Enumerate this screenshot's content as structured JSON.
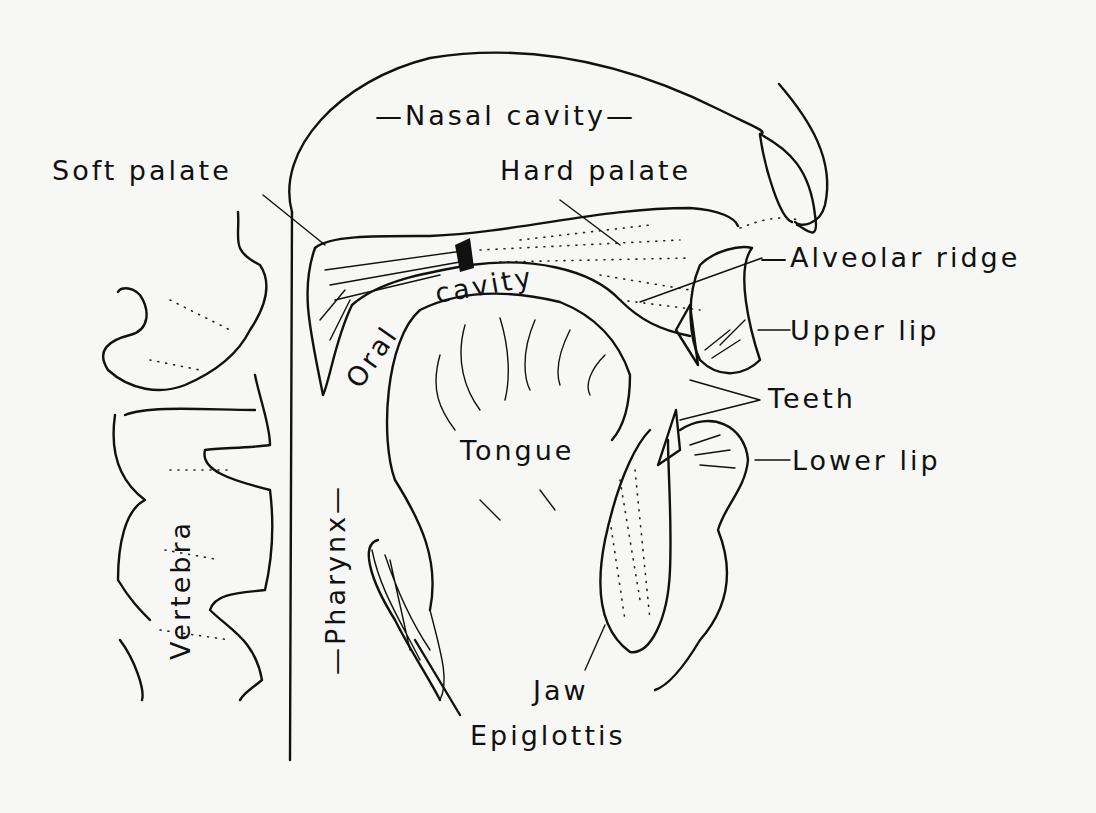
{
  "diagram": {
    "type": "anatomical sagittal section of the vocal tract",
    "labels": {
      "nasal_cavity": "Nasal cavity",
      "soft_palate": "Soft palate",
      "hard_palate": "Hard palate",
      "alveolar_ridge": "Alveolar ridge",
      "oral_cavity_1": "Oral",
      "oral_cavity_2": "cavity",
      "upper_lip": "Upper lip",
      "teeth": "Teeth",
      "tongue": "Tongue",
      "lower_lip": "Lower lip",
      "vertebra": "Vertebra",
      "pharynx": "Pharynx",
      "jaw": "Jaw",
      "epiglottis": "Epiglottis"
    },
    "colors": {
      "ink": "#111111",
      "paper": "#f7f7f5"
    }
  }
}
